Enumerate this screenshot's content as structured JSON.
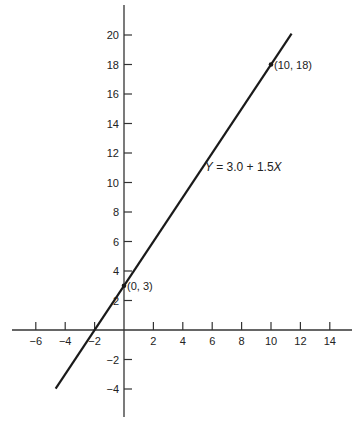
{
  "chart_data": {
    "type": "line",
    "title": "",
    "xlabel": "",
    "ylabel": "",
    "xlim": [
      -7.5,
      15.5
    ],
    "ylim": [
      -6,
      22.5
    ],
    "grid": false,
    "x_ticks": [
      -6,
      -4,
      -2,
      2,
      4,
      6,
      8,
      10,
      12,
      14
    ],
    "y_ticks": [
      -4,
      -2,
      2,
      4,
      6,
      8,
      10,
      12,
      14,
      16,
      18,
      20
    ],
    "x_tick_labels": [
      "−6",
      "−4",
      "−2",
      "2",
      "4",
      "6",
      "8",
      "10",
      "12",
      "14"
    ],
    "y_tick_labels": [
      "−4",
      "−2",
      "2",
      "4",
      "6",
      "8",
      "10",
      "12",
      "14",
      "16",
      "18",
      "20"
    ],
    "series": [
      {
        "name": "Y = 3.0 + 1.5X",
        "intercept": 3.0,
        "slope": 1.5,
        "x": [
          -4.65,
          11.4
        ],
        "y": [
          -3.98,
          20.1
        ]
      }
    ],
    "points": [
      {
        "x": 0,
        "y": 3,
        "label": "(0, 3)"
      },
      {
        "x": 10,
        "y": 18,
        "label": "(10, 18)"
      }
    ],
    "annotations": [
      {
        "text": "Y = 3.0 + 1.5X",
        "x": 5.5,
        "y": 10.8
      }
    ]
  },
  "labels": {
    "equation": "Y = 3.0 + 1.5X",
    "point_a": "(0, 3)",
    "point_b": "(10, 18)"
  }
}
